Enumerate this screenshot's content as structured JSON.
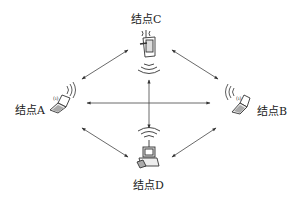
{
  "diagram": {
    "type": "wireless ad-hoc network topology",
    "nodes": [
      {
        "id": "A",
        "label": "结点A",
        "device": "laptop",
        "position": "left"
      },
      {
        "id": "B",
        "label": "结点B",
        "device": "laptop",
        "position": "right"
      },
      {
        "id": "C",
        "label": "结点C",
        "device": "pda",
        "position": "top"
      },
      {
        "id": "D",
        "label": "结点D",
        "device": "desktop",
        "position": "bottom"
      }
    ],
    "edges": [
      {
        "from": "A",
        "to": "C",
        "bidirectional": true
      },
      {
        "from": "C",
        "to": "B",
        "bidirectional": true
      },
      {
        "from": "A",
        "to": "D",
        "bidirectional": true
      },
      {
        "from": "D",
        "to": "B",
        "bidirectional": true
      },
      {
        "from": "A",
        "to": "B",
        "bidirectional": true
      },
      {
        "from": "C",
        "to": "D",
        "bidirectional": true
      }
    ],
    "colors": {
      "line": "#333333",
      "device": "#444444",
      "text": "#222222"
    }
  }
}
